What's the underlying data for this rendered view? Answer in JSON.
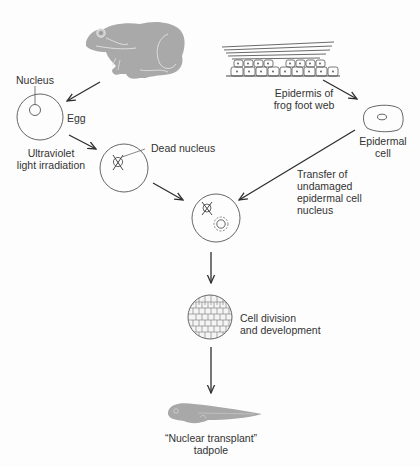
{
  "diagram": {
    "labels": {
      "nucleus": "Nucleus",
      "egg": "Egg",
      "uv": [
        "Ultraviolet",
        "light irradiation"
      ],
      "dead_nucleus": "Dead nucleus",
      "epidermis": [
        "Epidermis of",
        "frog foot web"
      ],
      "epidermal_cell": [
        "Epidermal",
        "cell"
      ],
      "transfer": [
        "Transfer of",
        "undamaged",
        "epidermal cell",
        "nucleus"
      ],
      "cell_division": [
        "Cell division",
        "and development"
      ],
      "tadpole": [
        "“Nuclear transplant”",
        "tadpole"
      ]
    },
    "nodes": [
      {
        "id": "frog",
        "name": "Adult frog"
      },
      {
        "id": "epidermis",
        "name": "Epidermis of frog foot web"
      },
      {
        "id": "egg",
        "name": "Egg"
      },
      {
        "id": "epidermal-cell",
        "name": "Epidermal cell"
      },
      {
        "id": "irradiated-egg",
        "name": "Egg with dead nucleus"
      },
      {
        "id": "recipient-egg",
        "name": "Egg receiving transplanted nucleus"
      },
      {
        "id": "embryo",
        "name": "Dividing embryo"
      },
      {
        "id": "tadpole",
        "name": "Nuclear transplant tadpole"
      }
    ],
    "edges": [
      {
        "from": "frog",
        "to": "egg"
      },
      {
        "from": "egg",
        "to": "irradiated-egg",
        "label": "Ultraviolet light irradiation"
      },
      {
        "from": "epidermis",
        "to": "epidermal-cell"
      },
      {
        "from": "irradiated-egg",
        "to": "recipient-egg"
      },
      {
        "from": "epidermal-cell",
        "to": "recipient-egg",
        "label": "Transfer of undamaged epidermal cell nucleus"
      },
      {
        "from": "recipient-egg",
        "to": "embryo"
      },
      {
        "from": "embryo",
        "to": "tadpole",
        "label": "Cell division and development"
      }
    ],
    "colors": {
      "line": "#3a3a3a",
      "frog_fill": "#aaaaaa",
      "tadpole_fill": "#a8a8a8",
      "background": "#fdfdfd"
    }
  }
}
